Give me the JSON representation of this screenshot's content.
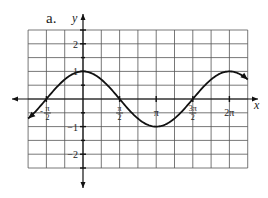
{
  "figure_label": "a.",
  "chart_data": {
    "type": "line",
    "title": "",
    "function": "y = cos(x)",
    "xlabel": "x",
    "ylabel": "y",
    "xlim": [
      -2.356,
      7.069
    ],
    "ylim": [
      -2.5,
      2.5
    ],
    "grid": true,
    "x_ticks": [
      {
        "value": -1.5708,
        "label": "-π/2"
      },
      {
        "value": 1.5708,
        "label": "π/2"
      },
      {
        "value": 3.1416,
        "label": "π"
      },
      {
        "value": 4.7124,
        "label": "3π/2"
      },
      {
        "value": 6.2832,
        "label": "2π"
      }
    ],
    "y_ticks": [
      {
        "value": 2,
        "label": "2"
      },
      {
        "value": 1,
        "label": "1"
      },
      {
        "value": -1,
        "label": "-1"
      },
      {
        "value": -2,
        "label": "-2"
      }
    ],
    "series": [
      {
        "name": "cos(x)",
        "x_range": [
          -2.356,
          7.069
        ],
        "points": [
          [
            -2.356,
            -0.707
          ],
          [
            -1.571,
            0
          ],
          [
            0,
            1
          ],
          [
            1.571,
            0
          ],
          [
            3.142,
            -1
          ],
          [
            4.712,
            0
          ],
          [
            6.283,
            1
          ],
          [
            7.069,
            0.707
          ]
        ],
        "arrows": "both",
        "color": "#111111"
      }
    ]
  },
  "colors": {
    "grid": "#555555",
    "axis": "#111111",
    "curve": "#111111",
    "background": "#ffffff"
  }
}
